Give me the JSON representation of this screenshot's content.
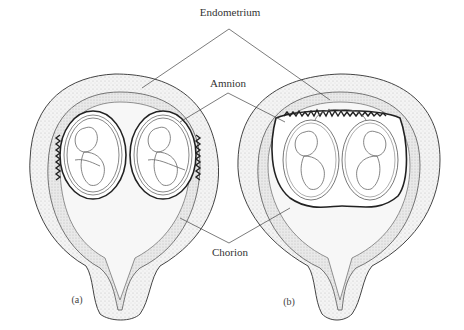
{
  "figure": {
    "labels": {
      "endometrium": "Endometrium",
      "amnion": "Amnion",
      "chorion": "Chorion"
    },
    "panels": [
      {
        "id": "a",
        "label": "(a)",
        "type": "dichorionic — two separate chorionic sacs"
      },
      {
        "id": "b",
        "label": "(b)",
        "type": "monochorionic — shared chorion, separate amnions"
      }
    ],
    "colors": {
      "line": "#333333",
      "stipple": "#bdbdbd",
      "wall_fill": "#f2f2f2",
      "cavity_fill": "#e6e6e6",
      "background": "#ffffff"
    }
  }
}
